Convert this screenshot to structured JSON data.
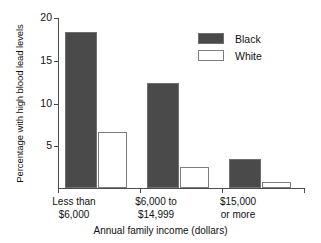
{
  "chart_data": {
    "type": "bar",
    "title": "",
    "xlabel": "Annual family income (dollars)",
    "ylabel": "Percentage with high blood lead levels",
    "categories": [
      "Less than $6,000",
      "$6,000 to $14,999",
      "$15,000 or more"
    ],
    "category_lines": [
      [
        "Less than",
        "$6,000"
      ],
      [
        "$6,000 to",
        "$14,999"
      ],
      [
        "$15,000",
        "or more"
      ]
    ],
    "series": [
      {
        "name": "Black",
        "color": "#4a4a4a",
        "values": [
          18.3,
          12.3,
          3.4
        ]
      },
      {
        "name": "White",
        "color": "#ffffff",
        "values": [
          6.6,
          2.4,
          0.7
        ]
      }
    ],
    "ylim": [
      0,
      20
    ],
    "yticks": [
      5,
      10,
      15,
      20
    ],
    "ytick_labels": [
      "5",
      "10",
      "15",
      "20"
    ],
    "grid": false,
    "legend_position": "upper right"
  },
  "legend": {
    "items": [
      {
        "label": "Black"
      },
      {
        "label": "White"
      }
    ]
  },
  "axes": {
    "y_title": "Percentage with high blood lead levels",
    "x_title": "Annual family income (dollars)",
    "ytick_0": "20",
    "ytick_1": "15",
    "ytick_2": "10",
    "ytick_3": "5"
  },
  "categories": {
    "c0_line1": "Less than",
    "c0_line2": "$6,000",
    "c1_line1": "$6,000 to",
    "c1_line2": "$14,999",
    "c2_line1": "$15,000",
    "c2_line2": "or more"
  }
}
